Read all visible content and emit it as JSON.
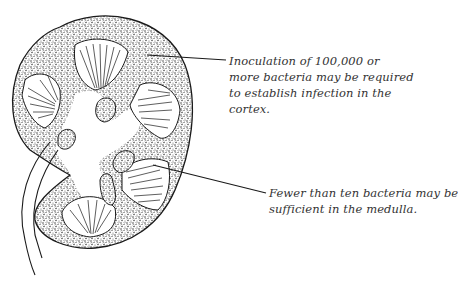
{
  "figure": {
    "colors": {
      "ink": "#1a1a1a",
      "background": "#ffffff",
      "text": "#333333"
    },
    "annotations": [
      {
        "id": "cortex",
        "lines": [
          "Inoculation of 100,000 or",
          "more bacteria may be required",
          "to establish infection in the",
          "cortex."
        ]
      },
      {
        "id": "medulla",
        "lines": [
          "Fewer than ten bacteria may be",
          "sufficient in the medulla."
        ]
      }
    ]
  }
}
